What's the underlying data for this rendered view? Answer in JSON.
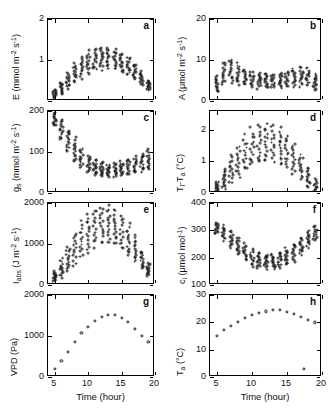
{
  "figure": {
    "xlabel": "Time (hour)",
    "xticks": [
      5,
      10,
      15,
      20
    ],
    "xlim": [
      4,
      20
    ]
  },
  "chart_data": [
    {
      "id": "a",
      "type": "scatter",
      "panel_label": "a",
      "ylabel": "E (mmol m⁻² s⁻¹)",
      "ylabel_parts": {
        "sym": "E",
        "unit": " (mmol m",
        "exp1": "-2",
        "mid": " s",
        "exp2": "-1",
        "tail": ")"
      },
      "xlabel": "Time (hour)",
      "ylim": [
        0,
        2
      ],
      "yticks": [
        0,
        1,
        2
      ],
      "ytick_labels": [
        "",
        "1",
        "2"
      ],
      "xlim": [
        4,
        20
      ],
      "grid": false,
      "marker": "open-circle",
      "x": [
        5,
        6,
        7,
        8,
        9,
        10,
        11,
        12,
        13,
        14,
        15,
        16,
        17,
        18,
        19
      ],
      "y_mean": [
        0.18,
        0.32,
        0.5,
        0.68,
        0.82,
        0.93,
        1.0,
        1.04,
        1.05,
        1.01,
        0.94,
        0.85,
        0.72,
        0.55,
        0.38
      ],
      "y_spread": [
        0.1,
        0.15,
        0.2,
        0.24,
        0.26,
        0.28,
        0.28,
        0.28,
        0.28,
        0.27,
        0.26,
        0.24,
        0.21,
        0.17,
        0.13
      ],
      "n_per_x": 14
    },
    {
      "id": "b",
      "type": "scatter",
      "panel_label": "b",
      "ylabel": "A (μmol m⁻² s⁻¹)",
      "ylabel_parts": {
        "sym": "A",
        "unit": " (μmol m",
        "exp1": "-2",
        "mid": " s",
        "exp2": "-1",
        "tail": ")"
      },
      "xlabel": "Time (hour)",
      "ylim": [
        0,
        20
      ],
      "yticks": [
        0,
        10,
        20
      ],
      "ytick_labels": [
        "0",
        "10",
        "20"
      ],
      "xlim": [
        4,
        20
      ],
      "grid": false,
      "marker": "open-circle",
      "x": [
        5,
        6,
        7,
        8,
        9,
        10,
        11,
        12,
        13,
        14,
        15,
        16,
        17,
        18,
        19
      ],
      "y_mean": [
        4.2,
        6.6,
        7.4,
        6.6,
        5.8,
        5.3,
        5.0,
        4.9,
        4.9,
        5.0,
        5.3,
        5.6,
        6.0,
        5.8,
        4.6
      ],
      "y_spread": [
        2.2,
        3.0,
        3.2,
        2.6,
        2.2,
        2.0,
        1.9,
        1.8,
        1.8,
        1.9,
        2.0,
        2.2,
        2.4,
        2.3,
        1.9
      ],
      "n_per_x": 14
    },
    {
      "id": "c",
      "type": "scatter",
      "panel_label": "c",
      "ylabel": "gs (mmol m⁻² s⁻¹)",
      "ylabel_parts": {
        "sym": "g",
        "symsub": "s",
        "unit": " (mmol m",
        "exp1": "-2",
        "mid": " s",
        "exp2": "-1",
        "tail": ")"
      },
      "xlabel": "Time (hour)",
      "ylim": [
        0,
        200
      ],
      "yticks": [
        0,
        100,
        200
      ],
      "ytick_labels": [
        "0",
        "100",
        "200"
      ],
      "xlim": [
        4,
        20
      ],
      "grid": false,
      "marker": "open-circle",
      "x": [
        5,
        6,
        7,
        8,
        9,
        10,
        11,
        12,
        13,
        14,
        15,
        16,
        17,
        18,
        19
      ],
      "y_mean": [
        180,
        155,
        128,
        104,
        84,
        70,
        62,
        57,
        55,
        56,
        59,
        63,
        68,
        74,
        80
      ],
      "y_spread": [
        18,
        26,
        30,
        30,
        26,
        22,
        19,
        17,
        16,
        17,
        18,
        20,
        22,
        24,
        26
      ],
      "n_per_x": 14
    },
    {
      "id": "d",
      "type": "scatter",
      "panel_label": "d",
      "ylabel": "Tl-Ta (°C)",
      "ylabel_parts": {
        "sym": "T",
        "symsub": "l",
        "dash": "-T",
        "symsub2": "a",
        "tail": " (°C)"
      },
      "xlabel": "Time (hour)",
      "ylim": [
        0,
        2.6
      ],
      "yticks": [
        0,
        1,
        2
      ],
      "ytick_labels": [
        "0",
        "1",
        "2"
      ],
      "xlim": [
        4,
        20
      ],
      "grid": false,
      "marker": "open-circle",
      "x": [
        5,
        6,
        7,
        8,
        9,
        10,
        11,
        12,
        13,
        14,
        15,
        16,
        17,
        18,
        19
      ],
      "y_mean": [
        0.18,
        0.42,
        0.72,
        1.0,
        1.24,
        1.42,
        1.53,
        1.58,
        1.56,
        1.47,
        1.32,
        1.1,
        0.82,
        0.5,
        0.22
      ],
      "y_spread": [
        0.2,
        0.34,
        0.46,
        0.54,
        0.6,
        0.62,
        0.62,
        0.62,
        0.62,
        0.6,
        0.56,
        0.5,
        0.42,
        0.32,
        0.22
      ],
      "n_per_x": 14
    },
    {
      "id": "e",
      "type": "scatter",
      "panel_label": "e",
      "ylabel": "Iabs (J m⁻² s⁻¹)",
      "ylabel_parts": {
        "sym": "I",
        "symsub": "abs",
        "unit": " (J m",
        "exp1": "-2",
        "mid": " s",
        "exp2": "-1",
        "tail": ")"
      },
      "xlabel": "Time (hour)",
      "ylim": [
        0,
        2000
      ],
      "yticks": [
        0,
        1000,
        2000
      ],
      "ytick_labels": [
        "0",
        "1000",
        "2000"
      ],
      "xlim": [
        4,
        20
      ],
      "grid": false,
      "marker": "open-circle",
      "x": [
        5,
        6,
        7,
        8,
        9,
        10,
        11,
        12,
        13,
        14,
        15,
        16,
        17,
        18,
        19
      ],
      "y_mean": [
        210,
        400,
        640,
        880,
        1090,
        1270,
        1400,
        1470,
        1470,
        1400,
        1270,
        1090,
        860,
        610,
        370
      ],
      "y_spread": [
        120,
        230,
        330,
        400,
        450,
        480,
        490,
        490,
        490,
        480,
        450,
        400,
        330,
        240,
        150
      ],
      "n_per_x": 14
    },
    {
      "id": "f",
      "type": "scatter",
      "panel_label": "f",
      "ylabel": "ci (μmol mol⁻¹)",
      "ylabel_parts": {
        "sym": "c",
        "symsub": "i",
        "unit": " (μmol mol",
        "exp1": "-1",
        "tail": ")"
      },
      "xlabel": "Time (hour)",
      "ylim": [
        100,
        400
      ],
      "yticks": [
        100,
        200,
        300,
        400
      ],
      "ytick_labels": [
        "100",
        "200",
        "300",
        "400"
      ],
      "xlim": [
        4,
        20
      ],
      "grid": false,
      "marker": "open-circle",
      "x": [
        5,
        6,
        7,
        8,
        9,
        10,
        11,
        12,
        13,
        14,
        15,
        16,
        17,
        18,
        19
      ],
      "y_mean": [
        308,
        290,
        268,
        243,
        218,
        200,
        190,
        186,
        186,
        192,
        203,
        220,
        242,
        268,
        290
      ],
      "y_spread": [
        22,
        28,
        32,
        34,
        34,
        32,
        30,
        28,
        28,
        30,
        32,
        34,
        34,
        32,
        28
      ],
      "n_per_x": 14
    },
    {
      "id": "g",
      "type": "scatter",
      "panel_label": "g",
      "ylabel": "VPD (Pa)",
      "ylabel_parts": {
        "sym": "VPD (Pa)"
      },
      "xlabel": "Time (hour)",
      "ylim": [
        0,
        2000
      ],
      "yticks": [
        0,
        1000,
        2000
      ],
      "ytick_labels": [
        "0",
        "1000",
        "2000"
      ],
      "xlim": [
        4,
        20
      ],
      "grid": false,
      "marker": "open-circle",
      "x": [
        5,
        6,
        7,
        8,
        9,
        10,
        11,
        12,
        13,
        14,
        15,
        16,
        17,
        18,
        19
      ],
      "y_mean": [
        200,
        390,
        620,
        860,
        1080,
        1230,
        1370,
        1470,
        1520,
        1520,
        1450,
        1340,
        1180,
        1010,
        850
      ],
      "y_spread": [
        0,
        0,
        0,
        0,
        0,
        0,
        0,
        0,
        0,
        0,
        0,
        0,
        0,
        0,
        0
      ],
      "n_per_x": 1
    },
    {
      "id": "h",
      "type": "scatter",
      "panel_label": "h",
      "ylabel": "Ta (°C)",
      "ylabel_parts": {
        "sym": "T",
        "symsub": "a",
        "tail": " (°C)"
      },
      "xlabel": "Time (hour)",
      "ylim": [
        0,
        30
      ],
      "yticks": [
        0,
        10,
        20,
        30
      ],
      "ytick_labels": [
        "0",
        "10",
        "20",
        "30"
      ],
      "xlim": [
        4,
        20
      ],
      "grid": false,
      "marker": "open-circle",
      "x": [
        5,
        6,
        7,
        8,
        9,
        10,
        11,
        12,
        13,
        14,
        15,
        16,
        17,
        18,
        19,
        17.4
      ],
      "y_mean": [
        15.0,
        17.3,
        18.8,
        20.2,
        21.6,
        22.6,
        23.4,
        24.0,
        24.4,
        24.4,
        23.8,
        23.0,
        22.1,
        21.0,
        20.0,
        3.0
      ],
      "y_spread": [
        0,
        0,
        0,
        0,
        0,
        0,
        0,
        0,
        0,
        0,
        0,
        0,
        0,
        0,
        0,
        0
      ],
      "n_per_x": 1
    }
  ]
}
